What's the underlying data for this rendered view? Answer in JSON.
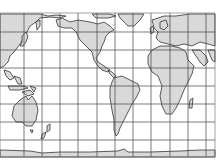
{
  "map": {
    "type": "world-outline-map",
    "projection": "equirectangular (Pacific-centered, 180° starts near Asia)",
    "colors": {
      "land": "#d9d9d9",
      "ocean": "#ffffff",
      "outline": "#333333",
      "grid": "#444444"
    },
    "bounds": {
      "x": 0,
      "y": 13,
      "width": 215,
      "height": 144
    },
    "grid": {
      "meridians_x": [
        24,
        42,
        60,
        78,
        97,
        115,
        133,
        151,
        170,
        188,
        206
      ],
      "parallels_y": [
        32,
        50,
        68,
        86,
        104,
        122,
        140
      ]
    },
    "features": [
      "asia-east",
      "australia",
      "new-zealand",
      "north-america",
      "south-america",
      "europe",
      "africa",
      "madagascar",
      "greenland",
      "antarctica",
      "southeast-asia-islands",
      "japan"
    ]
  }
}
